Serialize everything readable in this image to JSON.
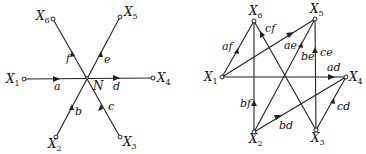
{
  "left_diagram": {
    "center": {
      "label": "N"
    },
    "nodes": [
      {
        "id": "X1",
        "label": "X",
        "sub": "1"
      },
      {
        "id": "X2",
        "label": "X",
        "sub": "2"
      },
      {
        "id": "X3",
        "label": "X",
        "sub": "3"
      },
      {
        "id": "X4",
        "label": "X",
        "sub": "4"
      },
      {
        "id": "X5",
        "label": "X",
        "sub": "5"
      },
      {
        "id": "X6",
        "label": "X",
        "sub": "6"
      }
    ],
    "edges": [
      {
        "from": "X1",
        "to": "N",
        "label": "a"
      },
      {
        "from": "X2",
        "to": "N",
        "label": "b"
      },
      {
        "from": "X3",
        "to": "N",
        "label": "c"
      },
      {
        "from": "N",
        "to": "X4",
        "label": "d"
      },
      {
        "from": "N",
        "to": "X5",
        "label": "e"
      },
      {
        "from": "N",
        "to": "X6",
        "label": "f"
      }
    ]
  },
  "right_diagram": {
    "nodes": [
      {
        "id": "X1",
        "label": "X",
        "sub": "1"
      },
      {
        "id": "X2",
        "label": "X",
        "sub": "2"
      },
      {
        "id": "X3",
        "label": "X",
        "sub": "3"
      },
      {
        "id": "X4",
        "label": "X",
        "sub": "4"
      },
      {
        "id": "X5",
        "label": "X",
        "sub": "5"
      },
      {
        "id": "X6",
        "label": "X",
        "sub": "6"
      }
    ],
    "edges": [
      {
        "from": "X1",
        "to": "X4",
        "label": "ad"
      },
      {
        "from": "X1",
        "to": "X5",
        "label": "ae"
      },
      {
        "from": "X1",
        "to": "X6",
        "label": "af"
      },
      {
        "from": "X2",
        "to": "X4",
        "label": "bd"
      },
      {
        "from": "X2",
        "to": "X5",
        "label": "be"
      },
      {
        "from": "X2",
        "to": "X6",
        "label": "bf"
      },
      {
        "from": "X3",
        "to": "X4",
        "label": "cd"
      },
      {
        "from": "X3",
        "to": "X5",
        "label": "ce"
      },
      {
        "from": "X3",
        "to": "X6",
        "label": "cf"
      }
    ]
  }
}
